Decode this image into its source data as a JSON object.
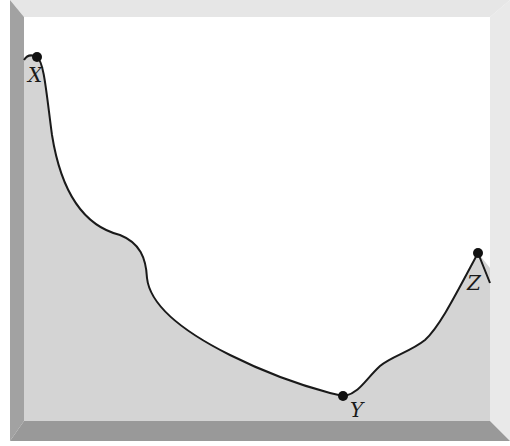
{
  "diagram": {
    "type": "terrain-profile",
    "colors": {
      "page_bg": "#ffffff",
      "frame_top": "#e6e6e6",
      "frame_right": "#e9e9e9",
      "frame_left": "#a2a2a2",
      "frame_bottom": "#999999",
      "sky": "#ffffff",
      "ground": "#d4d4d4",
      "curve": "#1a1a1a",
      "point": "#111111"
    },
    "points": [
      {
        "id": "X",
        "label": "X",
        "x": 37,
        "y": 57
      },
      {
        "id": "Y",
        "label": "Y",
        "x": 343,
        "y": 396
      },
      {
        "id": "Z",
        "label": "Z",
        "x": 478,
        "y": 253
      }
    ],
    "labels": {
      "X": "X",
      "Y": "Y",
      "Z": "Z"
    }
  }
}
